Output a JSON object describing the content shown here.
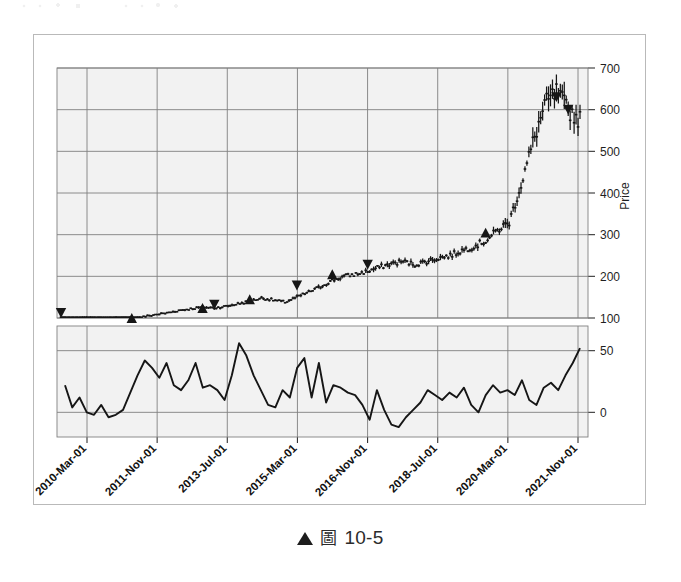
{
  "figure": {
    "caption_marker": "▲",
    "caption_symbol": "圖",
    "caption_number": "10-5",
    "background_color": "#ffffff",
    "plot_background_color": "#f2f2f2",
    "frame_color": "#b9b9b9",
    "grid_color": "#808080",
    "series_color": "#161616"
  },
  "chart_data": {
    "type": "line",
    "title": "",
    "subtitle": "",
    "xlabel": "",
    "ylabel": "Price",
    "grid": true,
    "legend": "none",
    "annotations": [
      "buy marker up-triangle",
      "sell marker down-triangle"
    ],
    "panels": [
      {
        "name": "price-panel",
        "ylabel": "Price",
        "ylim": [
          100,
          700
        ],
        "yticks": [
          100,
          200,
          300,
          400,
          500,
          600,
          700
        ],
        "ytick_labels": [
          "100",
          "200",
          "300",
          "400",
          "500",
          "600",
          "700"
        ],
        "series_type": "ohlc-bars",
        "series_name": "Price",
        "x": [
          "2010-Mar-01",
          "2010-Jun-01",
          "2010-Sep-01",
          "2010-Dec-01",
          "2011-Mar-01",
          "2011-Jun-01",
          "2011-Sep-01",
          "2011-Nov-01",
          "2012-Feb-01",
          "2012-May-01",
          "2012-Aug-01",
          "2012-Nov-01",
          "2013-Feb-01",
          "2013-Jul-01",
          "2013-Oct-01",
          "2014-Jan-01",
          "2014-Apr-01",
          "2014-Jul-01",
          "2014-Oct-01",
          "2015-Mar-01",
          "2015-Jun-01",
          "2015-Sep-01",
          "2015-Dec-01",
          "2016-Mar-01",
          "2016-Jun-01",
          "2016-Nov-01",
          "2017-Feb-01",
          "2017-May-01",
          "2017-Aug-01",
          "2017-Nov-01",
          "2018-Feb-01",
          "2018-Jul-01",
          "2018-Oct-01",
          "2019-Jan-01",
          "2019-Apr-01",
          "2019-Jul-01",
          "2019-Oct-01",
          "2020-Mar-01",
          "2020-Jun-01",
          "2020-Sep-01",
          "2020-Dec-01",
          "2021-Mar-01",
          "2021-Jun-01",
          "2021-Nov-01",
          "2022-Feb-01"
        ],
        "close": [
          84,
          86,
          88,
          90,
          92,
          96,
          99,
          103,
          108,
          112,
          118,
          122,
          126,
          124,
          128,
          134,
          140,
          148,
          143,
          138,
          150,
          162,
          175,
          190,
          200,
          205,
          212,
          222,
          230,
          236,
          228,
          236,
          244,
          250,
          262,
          272,
          285,
          310,
          330,
          420,
          520,
          610,
          640,
          600,
          575
        ],
        "markers": [
          {
            "type": "buy",
            "x": "2011-Sep-01",
            "price": 100
          },
          {
            "type": "sell",
            "x": "2011-Dec-01",
            "price": 112
          },
          {
            "type": "buy",
            "x": "2013-Feb-01",
            "price": 124
          },
          {
            "type": "sell",
            "x": "2013-Jul-01",
            "price": 132
          },
          {
            "type": "buy",
            "x": "2014-Apr-01",
            "price": 145
          },
          {
            "type": "sell",
            "x": "2015-Jun-01",
            "price": 178
          },
          {
            "type": "buy",
            "x": "2016-Mar-01",
            "price": 205
          },
          {
            "type": "sell",
            "x": "2017-Feb-01",
            "price": 228
          },
          {
            "type": "buy",
            "x": "2019-Oct-01",
            "price": 305
          },
          {
            "type": "sell",
            "x": "2021-Jun-01",
            "price": 630
          },
          {
            "type": "sell",
            "x": "2021-Nov-01",
            "price": 600
          }
        ]
      },
      {
        "name": "indicator-panel",
        "ylabel": "",
        "ylim": [
          -20,
          70
        ],
        "yticks": [
          0,
          50
        ],
        "ytick_labels": [
          "0",
          "50"
        ],
        "series_type": "line",
        "series_name": "Indicator",
        "values": [
          22,
          4,
          12,
          0,
          -2,
          6,
          -4,
          -2,
          2,
          16,
          30,
          42,
          36,
          28,
          40,
          22,
          18,
          26,
          40,
          20,
          22,
          18,
          10,
          30,
          56,
          46,
          30,
          18,
          6,
          4,
          18,
          12,
          36,
          44,
          12,
          40,
          8,
          22,
          20,
          16,
          14,
          6,
          -6,
          18,
          2,
          -10,
          -12,
          -4,
          2,
          8,
          18,
          14,
          10,
          16,
          12,
          20,
          6,
          0,
          14,
          22,
          16,
          18,
          14,
          26,
          10,
          6,
          20,
          24,
          18,
          30,
          40,
          52
        ]
      }
    ],
    "xticks": [
      "2010-Mar-01",
      "2011-Nov-01",
      "2013-Jul-01",
      "2015-Mar-01",
      "2016-Nov-01",
      "2018-Jul-01",
      "2020-Mar-01",
      "2021-Nov-01"
    ]
  }
}
